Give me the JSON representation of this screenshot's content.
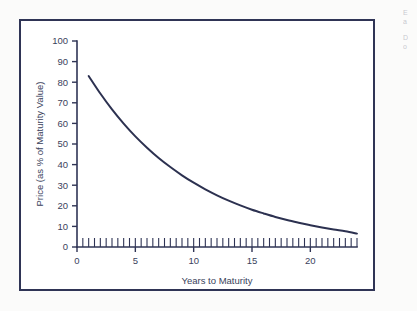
{
  "figure": {
    "frame_color": "#2f3455",
    "background_color": "#ffffff",
    "page_background": "#fbfbfa"
  },
  "edge_text": {
    "line1": "E",
    "line2": "a",
    "line3": "D",
    "line4": "o"
  },
  "chart_data": {
    "type": "line",
    "title": "",
    "subtitle": "",
    "xlabel": "Years to Maturity",
    "ylabel": "Price (as % of Maturity Value)",
    "xlim": [
      0,
      24
    ],
    "ylim": [
      0,
      100
    ],
    "grid": false,
    "legend": false,
    "legend_position": "none",
    "line_color": "#2c3150",
    "x_ticks_major": [
      0,
      5,
      10,
      15,
      20
    ],
    "x_tick_labels": [
      "0",
      "5",
      "10",
      "15",
      "20"
    ],
    "x_minor_tick_step": 0.5,
    "x_minor_tick_start": 0.5,
    "x_minor_tick_end": 24,
    "y_ticks_major": [
      0,
      10,
      20,
      30,
      40,
      50,
      60,
      70,
      80,
      90,
      100
    ],
    "y_tick_labels": [
      "0",
      "10",
      "20",
      "30",
      "40",
      "50",
      "60",
      "70",
      "80",
      "90",
      "100"
    ],
    "series": [
      {
        "name": "Price as % of maturity value",
        "x": [
          1,
          2,
          3,
          4,
          5,
          6,
          7,
          8,
          9,
          10,
          11,
          12,
          13,
          14,
          15,
          16,
          17,
          18,
          19,
          20,
          21,
          22,
          23,
          24
        ],
        "values": [
          83.0,
          74.5,
          66.8,
          59.9,
          53.7,
          48.2,
          43.2,
          38.8,
          34.8,
          31.2,
          28.0,
          25.1,
          22.5,
          20.2,
          18.1,
          16.3,
          14.6,
          13.1,
          11.8,
          10.6,
          9.5,
          8.5,
          7.6,
          6.5
        ]
      }
    ]
  }
}
